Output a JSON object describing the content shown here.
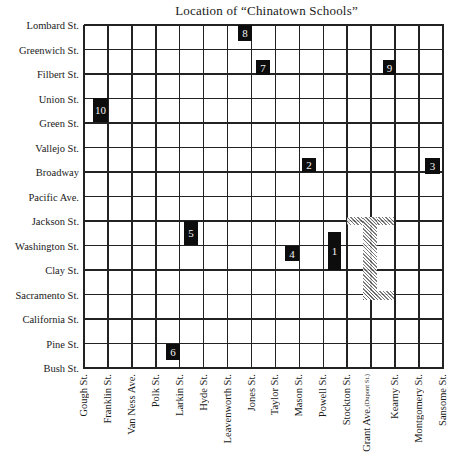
{
  "title": "Location of “Chinatown Schools”",
  "grid": {
    "left": 84,
    "top": 25,
    "col_width": 23.93,
    "row_height": 24.5,
    "cols": 15,
    "rows": 14,
    "line_color": "#222222"
  },
  "streets_horizontal": [
    "Lombard St.",
    "Greenwich St.",
    "Filbert St.",
    "Union St.",
    "Green St.",
    "Vallejo St.",
    "Broadway",
    "Pacific Ave.",
    "Jackson St.",
    "Washington St.",
    "Clay St.",
    "Sacramento St.",
    "California St.",
    "Pine St.",
    "Bush St."
  ],
  "streets_vertical": [
    {
      "name": "Gough St."
    },
    {
      "name": "Franklin St."
    },
    {
      "name": "Van Ness Ave."
    },
    {
      "name": "Polk St."
    },
    {
      "name": "Larkin St."
    },
    {
      "name": "Hyde St."
    },
    {
      "name": "Leavenworth St."
    },
    {
      "name": "Jones St."
    },
    {
      "name": "Taylor St."
    },
    {
      "name": "Mason St."
    },
    {
      "name": "Powell St."
    },
    {
      "name": "Stockton St."
    },
    {
      "name": "Grant Ave.",
      "sub": "(Dupont St.)"
    },
    {
      "name": "Kearny St."
    },
    {
      "name": "Montgomery St."
    },
    {
      "name": "Sansome St."
    }
  ],
  "schools": [
    {
      "label": "1",
      "x": 328,
      "y": 232,
      "w": 13,
      "h": 38
    },
    {
      "label": "2",
      "x": 302,
      "y": 158,
      "w": 14,
      "h": 14
    },
    {
      "label": "3",
      "x": 425,
      "y": 158,
      "w": 15,
      "h": 16
    },
    {
      "label": "4",
      "x": 285,
      "y": 246,
      "w": 14,
      "h": 15
    },
    {
      "label": "5",
      "x": 184,
      "y": 221,
      "w": 14,
      "h": 24
    },
    {
      "label": "6",
      "x": 166,
      "y": 344,
      "w": 14,
      "h": 16
    },
    {
      "label": "7",
      "x": 256,
      "y": 60,
      "w": 14,
      "h": 15
    },
    {
      "label": "8",
      "x": 238,
      "y": 25,
      "w": 14,
      "h": 16
    },
    {
      "label": "9",
      "x": 383,
      "y": 60,
      "w": 13,
      "h": 15
    },
    {
      "label": "10",
      "x": 93,
      "y": 98,
      "w": 15,
      "h": 24
    }
  ],
  "chinatown_area": {
    "description": "hatched bracket shape along Grant Ave.",
    "segments": [
      {
        "x": 347,
        "y": 217,
        "w": 47,
        "h": 8
      },
      {
        "x": 363,
        "y": 217,
        "w": 14,
        "h": 83
      },
      {
        "x": 363,
        "y": 291,
        "w": 31,
        "h": 9
      }
    ]
  }
}
